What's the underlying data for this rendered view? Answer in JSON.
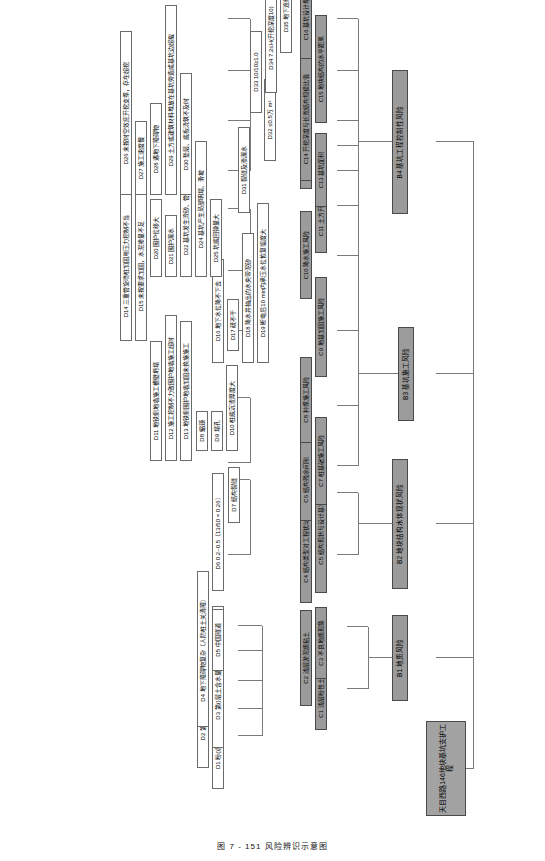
{
  "figure": {
    "caption": "图 7 - 151   风险辨识示意图",
    "header_note": "建筑施工安全生产技术与管理"
  },
  "root": {
    "id": "A",
    "label": "天目西路146地块基坑支护工程"
  },
  "level_b": [
    {
      "id": "B1",
      "label": "B1 地质风险"
    },
    {
      "id": "B2",
      "label": "B2 地块结构水体现状风险"
    },
    {
      "id": "B3",
      "label": "B3 基坑施工风险"
    },
    {
      "id": "B4",
      "label": "B4 基坑工程控制性风险"
    }
  ],
  "level_c": [
    {
      "id": "C1",
      "label": "C1 浅层粉性土、砂土"
    },
    {
      "id": "C2",
      "label": "C2 浅层淤泥质粘土"
    },
    {
      "id": "C3",
      "label": "C3 不良地质现象"
    },
    {
      "id": "C4",
      "label": "C4 结构类型对工程扰动的敏感性"
    },
    {
      "id": "C5",
      "label": "C5 结构现状与设计基准指比例"
    },
    {
      "id": "C6",
      "label": "C6 结构残余间隙"
    },
    {
      "id": "C7",
      "label": "C7 桩基础施工风险"
    },
    {
      "id": "C8",
      "label": "C8 种撑施工风险"
    },
    {
      "id": "C9",
      "label": "C9 地基加固施工风险"
    },
    {
      "id": "C10",
      "label": "C10 降水施工风险"
    },
    {
      "id": "C11",
      "label": "C11 土方开挖与支撑风险"
    },
    {
      "id": "C12",
      "label": "C12 主体结构施工风险"
    },
    {
      "id": "C13",
      "label": "C13 基坑面积"
    },
    {
      "id": "C14",
      "label": "C14 开挖深度与长宽结构规模比值"
    },
    {
      "id": "C15",
      "label": "C15 地块结构的水平距离"
    },
    {
      "id": "C16",
      "label": "C16 基坑设计埋深"
    }
  ],
  "level_d": [
    {
      "id": "D1",
      "label": "D1 粉()层人工填土，较厚2~5 m"
    },
    {
      "id": "D2",
      "label": "D2 第()层整性土、粉砂较厚>6 m"
    },
    {
      "id": "D3",
      "label": "D3 第()层土含水量高、十分软弱"
    },
    {
      "id": "D4",
      "label": "D4 地下障碍物复杂（人防桩土关清障）"
    },
    {
      "id": "D5",
      "label": "D5 中国隧道"
    },
    {
      "id": "D6",
      "label": "D6 0.2~0.5（13/50 = 0.26）"
    },
    {
      "id": "D7",
      "label": "D7 结构裂缝"
    },
    {
      "id": "D8",
      "label": "D8 缩颈"
    },
    {
      "id": "D9",
      "label": "D9 塌孔"
    },
    {
      "id": "D10",
      "label": "D10 桩底沉渣厚度大"
    },
    {
      "id": "D11",
      "label": "D11 地铁侧地墙施工槽壁坍塌"
    },
    {
      "id": "D12",
      "label": "D12 施工控制不力致围护地墙施工超时"
    },
    {
      "id": "D13",
      "label": "D13 地铁侧围护地墙加固未换施施工"
    },
    {
      "id": "D14",
      "label": "D14 三重管旋喷桩加固用压力控制不当"
    },
    {
      "id": "D15",
      "label": "D15 未按要求加固，水泥掺量不足"
    },
    {
      "id": "D16",
      "label": "D16 地下水位降不下去"
    },
    {
      "id": "D17",
      "label": "D17 疏不干"
    },
    {
      "id": "D18",
      "label": "D18 降水井抽出的水夹带泥砂"
    },
    {
      "id": "D19",
      "label": "D19 断电后10 min内承压水位恢复幅度大"
    },
    {
      "id": "D20",
      "label": "D20 围护位移大"
    },
    {
      "id": "D21",
      "label": "D21 围护漏水"
    },
    {
      "id": "D22",
      "label": "D22 基坑发生流砂、管涌"
    },
    {
      "id": "D24",
      "label": "D24 基坑产生局部明塌、滑坡"
    },
    {
      "id": "D25",
      "label": "D25 坑底回弹量大"
    },
    {
      "id": "D26",
      "label": "D26 未按时空效应开挖支撑，存在超挖"
    },
    {
      "id": "D27",
      "label": "D27 施工速度慢"
    },
    {
      "id": "D28",
      "label": "D28 遇地下障碍物"
    },
    {
      "id": "D29",
      "label": "D29 土方或建筑材料堆放在基坑旁造成基坑边超载"
    },
    {
      "id": "D30",
      "label": "D30 垫层、底板浇筑不及时"
    },
    {
      "id": "D31",
      "label": "D31 裂缝及渗漏水"
    },
    {
      "id": "D32",
      "label": "D32 ≤0.5万 m²"
    },
    {
      "id": "D33",
      "label": "D33 10/10≥1.0"
    },
    {
      "id": "D34",
      "label": "D34 7.2≤H(开挖深度10)"
    },
    {
      "id": "D35",
      "label": "D35 地下连续墙围护"
    }
  ],
  "colors": {
    "node_fill_plain": "#ffffff",
    "node_fill_shaded": "#9b9b9b",
    "node_border": "#6b6b6b",
    "connector": "#7a7a7a",
    "text": "#000000"
  }
}
